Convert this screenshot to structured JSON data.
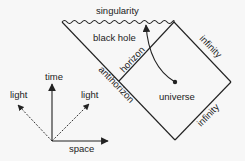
{
  "diagram": {
    "type": "penrose-diagram",
    "labels": {
      "singularity": "singularity",
      "black_hole": "black hole",
      "horizon": "horizon",
      "antihorizon": "antihorizon",
      "infinity_upper": "infinity",
      "infinity_lower": "infinity",
      "universe": "universe"
    },
    "axes": {
      "time": "time",
      "space": "space",
      "light_left": "light",
      "light_right": "light"
    },
    "colors": {
      "stroke": "#222222",
      "background": "#f7f7f7"
    }
  }
}
